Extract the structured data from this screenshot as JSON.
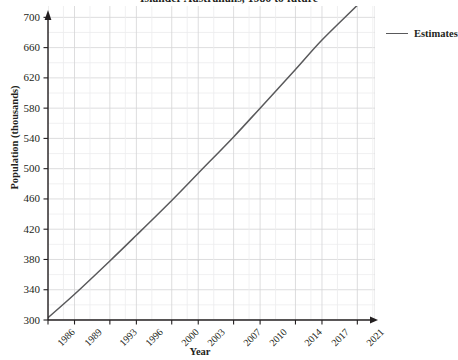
{
  "chart_data": {
    "type": "line",
    "title": "Islander Australians, 1986 to future",
    "xlabel": "Year",
    "ylabel": "Population (thousands)",
    "xlim": [
      1986,
      2023
    ],
    "ylim": [
      300,
      715
    ],
    "grid": true,
    "legend_position": "right",
    "x_tick_labels": [
      "1986",
      "1989",
      "1993",
      "1996",
      "2000",
      "2003",
      "2007",
      "2010",
      "2014",
      "2017",
      "2021"
    ],
    "y_tick_labels": [
      "300",
      "340",
      "380",
      "420",
      "460",
      "500",
      "540",
      "580",
      "620",
      "660",
      "700"
    ],
    "y_ticks": [
      300,
      340,
      380,
      420,
      460,
      500,
      540,
      580,
      620,
      660,
      700
    ],
    "series": [
      {
        "name": "Estimates",
        "color": "#59595b",
        "x": [
          1986,
          1989,
          1993,
          1996,
          2000,
          2003,
          2007,
          2010,
          2014,
          2017,
          2021,
          2023
        ],
        "values": [
          303,
          334,
          378,
          412,
          458,
          494,
          542,
          580,
          631,
          670,
          716,
          740
        ]
      }
    ]
  },
  "legend": {
    "entries": [
      {
        "label": "Estimates",
        "color": "#59595b"
      }
    ]
  },
  "axes": {
    "y_label": "Population (thousands)",
    "x_label": "Year"
  }
}
